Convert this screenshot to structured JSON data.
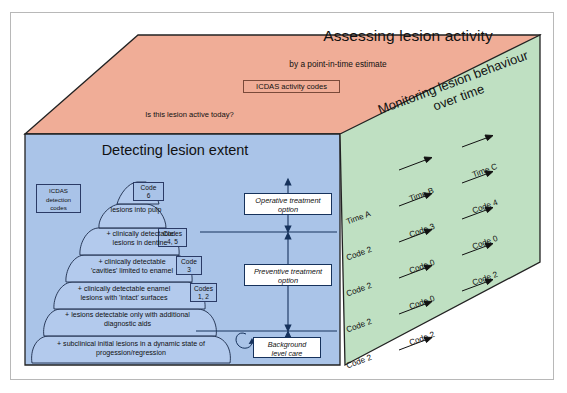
{
  "diagram": {
    "colors": {
      "top_face": "#f0ad97",
      "left_face": "#aac4e8",
      "right_face": "#bfe0c2",
      "outline": "#222222",
      "frame": "#b8b8b8",
      "box_fill": "#a9c3e8",
      "white_box": "#ffffff"
    }
  },
  "top_face": {
    "title": "Assessing lesion activity",
    "subtitle": "by a point-in-time estimate",
    "code_box": "ICDAS activity codes",
    "question": "Is this lesion active today?"
  },
  "left_face": {
    "title": "Detecting lesion extent",
    "codes_legend": "ICDAS\ndetection\ncodes",
    "codes_legend_lines": [
      "ICDAS",
      "detection",
      "codes"
    ],
    "pyramid": [
      {
        "code": "Code\n6",
        "code_lines": [
          "Code",
          "6"
        ],
        "label_lines": [
          "lesions into pulp"
        ]
      },
      {
        "code": "Codes\n4, 5",
        "code_lines": [
          "Codes",
          "4, 5"
        ],
        "label_lines": [
          "+ clinically detectable",
          "lesions in dentine"
        ]
      },
      {
        "code": "Code\n3",
        "code_lines": [
          "Code",
          "3"
        ],
        "label_lines": [
          "+ clinically detectable",
          "'cavities' limited to enamel"
        ]
      },
      {
        "code": "Codes\n1, 2",
        "code_lines": [
          "Codes",
          "1, 2"
        ],
        "label_lines": [
          "+ clinically detectable enamel",
          "lesions with 'intact' surfaces"
        ]
      },
      {
        "code": "",
        "code_lines": [],
        "label_lines": [
          "+ lesions detectable only with additional",
          "diagnostic aids"
        ]
      },
      {
        "code": "",
        "code_lines": [],
        "label_lines": [
          "+ subclinical initial lesions in a dynamic state of",
          "progession/regression"
        ]
      }
    ],
    "treatment_boxes": [
      {
        "lines": [
          "Operative treatment",
          "option"
        ]
      },
      {
        "lines": [
          "Preventive treatment",
          "option"
        ]
      },
      {
        "lines": [
          "Background",
          "level care"
        ]
      }
    ]
  },
  "right_face": {
    "title_lines": [
      "Monitoring lesion behaviour",
      "over time"
    ],
    "columns": [
      "Time A",
      "Time B",
      "Time C"
    ],
    "rows": [
      {
        "time_label": "Time A",
        "cells": [
          "Time A",
          "Time B",
          "Time C"
        ]
      },
      {
        "cells": [
          "Code 2",
          "Code 3",
          "Code 4"
        ]
      },
      {
        "cells": [
          "Code 2",
          "Code 0",
          "Code 0"
        ]
      },
      {
        "cells": [
          "Code 2",
          "Code 0",
          "Code 2"
        ]
      },
      {
        "cells": [
          "Code 2",
          "Code 2",
          ""
        ]
      },
      {
        "cells": [
          "Code 2",
          "",
          ""
        ]
      }
    ],
    "arrow_glyph": "→"
  }
}
